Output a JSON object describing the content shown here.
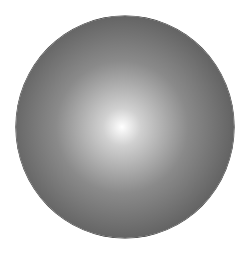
{
  "image": {
    "description": "Shaded gray sphere with radial gradient highlight",
    "shape": "circle",
    "colors": {
      "background": "#ffffff",
      "highlight": "#ffffff",
      "inner": "#d0d0d0",
      "mid": "#8a8a8a",
      "outer": "#5e5e5e",
      "rim": "#3a3a3a"
    },
    "geometry": {
      "center_x": 125,
      "center_y": 127,
      "radius_x": 109,
      "radius_y": 111,
      "highlight_x": 122,
      "highlight_y": 127
    }
  }
}
